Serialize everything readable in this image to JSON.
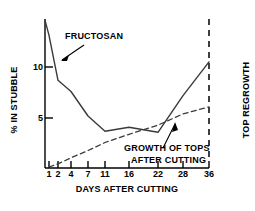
{
  "chart_data": {
    "type": "line",
    "title": "",
    "xlabel": "DAYS AFTER CUTTING",
    "ylabel": "% IN STUBBLE",
    "grid": false,
    "legend_position": "inline-annotations",
    "x_tick_labels": [
      "1",
      "2",
      "4",
      "7",
      "11",
      "16",
      "22",
      "28",
      "36"
    ],
    "x_tick_values": [
      1,
      2,
      4,
      7,
      11,
      16,
      22,
      28,
      36
    ],
    "x_axis_scale": "non-linear category spacing",
    "y_tick_labels": [
      "5",
      "10"
    ],
    "y_tick_values": [
      5,
      10
    ],
    "ylim": [
      0,
      14.6
    ],
    "xlim_labels": [
      "0",
      "36"
    ],
    "series": [
      {
        "name": "FRUCTOSAN",
        "style": "solid",
        "color": "#000000",
        "x": [
          0,
          1,
          2,
          4,
          7,
          11,
          16,
          22,
          28,
          36
        ],
        "values": [
          14.6,
          13.1,
          8.7,
          7.6,
          5.2,
          3.7,
          4.1,
          3.6,
          7.2,
          10.5
        ]
      },
      {
        "name": "GROWTH OF TOPS AFTER CUTTING",
        "style": "dashed",
        "color": "#000000",
        "x": [
          1,
          2,
          4,
          7,
          11,
          16,
          22,
          28,
          36
        ],
        "values": [
          0.2,
          0.5,
          1.1,
          1.8,
          2.6,
          3.4,
          4.3,
          5.4,
          6.1
        ]
      }
    ],
    "annotations": [
      {
        "id": "fructosan-callout",
        "text": "FRUCTOSAN",
        "points_to_series": "FRUCTOSAN",
        "has_leader_line": true
      },
      {
        "id": "growth-callout",
        "text": "GROWTH OF TOPS AFTER CUTTING",
        "points_to_series": "GROWTH OF TOPS AFTER CUTTING",
        "has_leader_line": true
      },
      {
        "id": "top-regrowth-marker",
        "text": "TOP REGROWTH",
        "marker_type": "vertical-dashed-line",
        "at_x": 36,
        "orientation": "vertical"
      }
    ]
  },
  "labels": {
    "y_axis_title": "% IN STUBBLE",
    "x_axis_title": "DAYS AFTER CUTTING",
    "fructosan": "FRUCTOSAN",
    "growth_line_1": "GROWTH OF TOPS",
    "growth_line_2": "AFTER CUTTING",
    "top_regrowth": "TOP REGROWTH"
  },
  "x_ticks": [
    {
      "label": "1"
    },
    {
      "label": "2"
    },
    {
      "label": "4"
    },
    {
      "label": "7"
    },
    {
      "label": "11"
    },
    {
      "label": "16"
    },
    {
      "label": "22"
    },
    {
      "label": "28"
    },
    {
      "label": "36"
    }
  ],
  "y_ticks": [
    {
      "label": "10"
    },
    {
      "label": "5"
    }
  ],
  "colors": {
    "background": "#ffffff",
    "ink": "#000000"
  }
}
